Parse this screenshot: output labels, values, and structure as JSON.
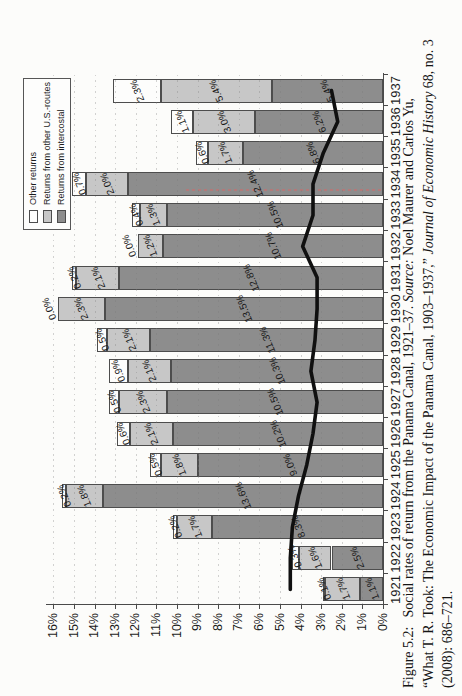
{
  "figure_caption": {
    "fig_label": "Figure 5.2:",
    "line1_text": "Social rates of return from the Panama Canal, 1921–37. ",
    "source_label": "Source:",
    "line1_tail": " Noel Maurer and Carlos Yu,",
    "line2_text": "“What T. R. Took: The Economic Impact of the Panama Canal, 1903–1937,” ",
    "journal": "Journal of Economic History",
    "line2_tail": " 68, no. 3",
    "line3": "(2008): 686–721."
  },
  "chart_data": {
    "type": "bar",
    "subtype": "stacked-bars-with-line-overlay",
    "orientation": "figure printed rotated 90deg counter-clockwise on portrait page",
    "title": "",
    "xlabel": "",
    "ylabel": "",
    "ylim": [
      0,
      16
    ],
    "grid": true,
    "legend_position": "top-right-inside",
    "categories": [
      1921,
      1922,
      1923,
      1924,
      1925,
      1926,
      1927,
      1928,
      1929,
      1930,
      1931,
      1932,
      1933,
      1934,
      1935,
      1936,
      1937
    ],
    "series": [
      {
        "name": "Returns from intercostal",
        "color": "#8d8d8d",
        "values": [
          1.1,
          2.5,
          8.3,
          13.6,
          9.0,
          10.2,
          10.5,
          10.3,
          11.3,
          13.5,
          12.8,
          10.7,
          10.5,
          12.4,
          6.8,
          6.2,
          5.4
        ]
      },
      {
        "name": "Returns from other U.S.-routes",
        "color": "#c7c7c7",
        "values": [
          1.7,
          1.6,
          1.7,
          1.8,
          1.8,
          2.1,
          2.3,
          2.1,
          2.1,
          2.3,
          2.1,
          1.2,
          1.3,
          2.0,
          1.7,
          3.0,
          5.4
        ]
      },
      {
        "name": "Other returns",
        "color": "#fdfdfc",
        "values": [
          0.1,
          -0.3,
          0.2,
          0.2,
          0.5,
          0.6,
          0.5,
          0.9,
          0.5,
          0.0,
          0.2,
          0.0,
          0.4,
          0.7,
          0.6,
          1.1,
          2.3
        ]
      }
    ],
    "line_overlay": {
      "name": "benchmark-rate-line",
      "color": "#101010",
      "values": [
        4.5,
        4.5,
        4.4,
        4.1,
        3.7,
        3.4,
        3.2,
        3.5,
        3.3,
        3.2,
        3.2,
        3.9,
        3.4,
        3.4,
        2.9,
        2.2,
        2.5
      ]
    },
    "yticks": [
      "0%",
      "1%",
      "2%",
      "3%",
      "4%",
      "5%",
      "6%",
      "7%",
      "8%",
      "9%",
      "10%",
      "11%",
      "12%",
      "13%",
      "14%",
      "15%",
      "16%"
    ],
    "legend": [
      "Other returns",
      "Returns from other U.S.-routes",
      "Returns from intercostal"
    ]
  }
}
